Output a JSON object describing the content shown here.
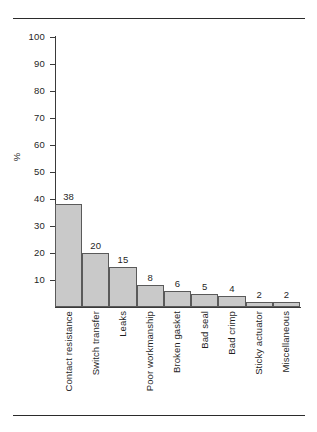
{
  "chart_data": {
    "type": "bar",
    "title": "",
    "subtitle": "",
    "xlabel": "",
    "ylabel": "%",
    "ylim": [
      0,
      100
    ],
    "ytick_step": 10,
    "yticks": [
      100,
      90,
      80,
      70,
      60,
      50,
      40,
      30,
      20,
      10
    ],
    "grid": false,
    "legend": null,
    "bar_gap": 0,
    "bar_fill": "#c9c9c9",
    "bar_stroke": "#5a5a5a",
    "value_labels_shown": true,
    "categories": [
      "Contact  resistance",
      "Switch transfer",
      "Leaks",
      "Poor workmanship",
      "Broken gasket",
      "Bad seal",
      "Bad crimp",
      "Sticky actuator",
      "Miscellaneous"
    ],
    "values": [
      38,
      20,
      15,
      8,
      6,
      5,
      4,
      2,
      2
    ],
    "value_label_texts": [
      "38",
      "20",
      "15",
      "8",
      "6",
      "5",
      "4",
      "2",
      "2"
    ],
    "ytick_labels": [
      "100",
      "90",
      "80",
      "70",
      "60",
      "50",
      "40",
      "30",
      "20",
      "10"
    ]
  },
  "rules": {
    "top": "",
    "bottom": ""
  }
}
